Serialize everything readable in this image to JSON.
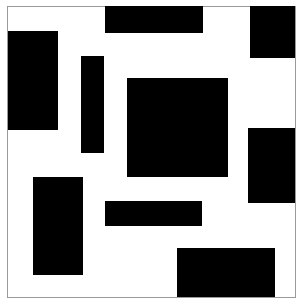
{
  "page": {
    "canvas_width": 303,
    "canvas_height": 306,
    "background_color": "#ffffff",
    "shape_color": "#000000",
    "border_color": "#9a9a9a"
  },
  "frame": {
    "name": "image-border-frame",
    "x": 7,
    "y": 6,
    "width": 289,
    "height": 292,
    "border_width": 1,
    "color": "#9a9a9a"
  },
  "shapes": [
    {
      "id": "rect-top-left-tall",
      "label": "Top left tall rectangle",
      "x": 8,
      "y": 31,
      "width": 50,
      "height": 99,
      "color": "#000000"
    },
    {
      "id": "rect-top-center-bar",
      "label": "Top center horizontal bar",
      "x": 105,
      "y": 6,
      "width": 98,
      "height": 27,
      "color": "#000000"
    },
    {
      "id": "rect-top-right-square",
      "label": "Top right square",
      "x": 250,
      "y": 6,
      "width": 45,
      "height": 52,
      "color": "#000000"
    },
    {
      "id": "rect-upper-thin-vertical",
      "label": "Upper thin vertical bar",
      "x": 81,
      "y": 56,
      "width": 23,
      "height": 97,
      "color": "#000000"
    },
    {
      "id": "rect-center-square",
      "label": "Center large square",
      "x": 127,
      "y": 78,
      "width": 101,
      "height": 99,
      "color": "#000000"
    },
    {
      "id": "rect-right-middle",
      "label": "Right middle rectangle",
      "x": 248,
      "y": 128,
      "width": 47,
      "height": 75,
      "color": "#000000"
    },
    {
      "id": "rect-lower-left-tall",
      "label": "Lower left tall rectangle",
      "x": 33,
      "y": 177,
      "width": 50,
      "height": 98,
      "color": "#000000"
    },
    {
      "id": "rect-lower-center-bar",
      "label": "Lower center horizontal bar",
      "x": 105,
      "y": 201,
      "width": 97,
      "height": 25,
      "color": "#000000"
    },
    {
      "id": "rect-bottom-right",
      "label": "Bottom right rectangle",
      "x": 177,
      "y": 248,
      "width": 98,
      "height": 49,
      "color": "#000000"
    }
  ],
  "chart_data": {
    "type": "scatter",
    "xlabel": "",
    "ylabel": "",
    "xlim": [
      0,
      303
    ],
    "ylim": [
      0,
      306
    ],
    "grid": false,
    "legend": "none",
    "note": "Nine solid black axis-aligned rectangles on a white field enclosed by a thin grey border.",
    "categories": [
      "rect-top-left-tall",
      "rect-top-center-bar",
      "rect-top-right-square",
      "rect-upper-thin-vertical",
      "rect-center-square",
      "rect-right-middle",
      "rect-lower-left-tall",
      "rect-lower-center-bar",
      "rect-bottom-right"
    ],
    "series": [
      {
        "name": "x",
        "values": [
          8,
          105,
          250,
          81,
          127,
          248,
          33,
          105,
          177
        ]
      },
      {
        "name": "y",
        "values": [
          31,
          6,
          6,
          56,
          78,
          128,
          177,
          201,
          248
        ]
      },
      {
        "name": "width",
        "values": [
          50,
          98,
          45,
          23,
          101,
          47,
          50,
          97,
          98
        ]
      },
      {
        "name": "height",
        "values": [
          99,
          27,
          52,
          97,
          99,
          75,
          98,
          25,
          49
        ]
      },
      {
        "name": "area",
        "values": [
          4950,
          2646,
          2340,
          2231,
          9999,
          3525,
          4900,
          2425,
          4802
        ]
      }
    ]
  }
}
